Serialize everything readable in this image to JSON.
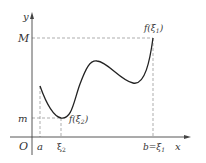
{
  "diagram": {
    "type": "function-graph",
    "axes": {
      "x_label": "x",
      "y_label": "y",
      "origin_label": "O"
    },
    "x_ticks": {
      "a": "a",
      "xi2": "ξ",
      "xi2_sub": "2",
      "b_eq": "b=ξ",
      "b_eq_sub": "1"
    },
    "y_ticks": {
      "M": "M",
      "m": "m"
    },
    "annotations": {
      "max_point": {
        "prefix": "f(ξ",
        "sub": "1",
        "suffix": ")"
      },
      "min_point": {
        "prefix": "f(ξ",
        "sub": "2",
        "suffix": ")"
      }
    },
    "colors": {
      "curve": "#222222",
      "axis": "#444444",
      "dashed": "#888888",
      "text": "#333333"
    }
  }
}
